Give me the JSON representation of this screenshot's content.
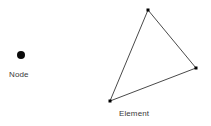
{
  "figure": {
    "title": "",
    "background_color": "#ffffff",
    "width": 211,
    "height": 126,
    "stroke_color": "#4a4a4a",
    "marker_color": "#000000",
    "text_color": "#3a3a3a"
  },
  "node": {
    "label": "Node",
    "icon": "filled-circle-marker",
    "center_x": 21,
    "center_y": 55,
    "radius": 4,
    "color": "#0a0a0a"
  },
  "element": {
    "label": "Element",
    "shape": "triangle",
    "stroke_color": "#4a4a4a",
    "stroke_width": 1,
    "fill": "none",
    "vertices": [
      {
        "name": "apex",
        "x": 148,
        "y": 10
      },
      {
        "name": "right",
        "x": 196,
        "y": 68
      },
      {
        "name": "bottom-left",
        "x": 110,
        "y": 101
      }
    ],
    "vertex_marker": {
      "shape": "square",
      "size": 3,
      "color": "#000000"
    }
  }
}
